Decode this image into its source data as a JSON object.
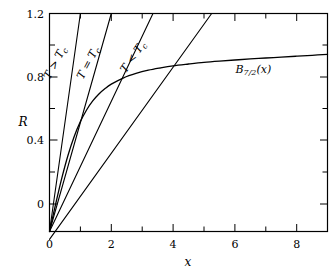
{
  "chart_data": {
    "type": "line",
    "title": "",
    "subtitle": "",
    "xlabel": "x",
    "ylabel": "R",
    "xlim": [
      0,
      9
    ],
    "ylim": [
      0,
      1.2
    ],
    "grid": false,
    "legend_position": "inline-annotations",
    "x_ticks_major": [
      0,
      2,
      4,
      6,
      8
    ],
    "x_ticks_minor": [
      1,
      3,
      5,
      7,
      9
    ],
    "x_tick_labels": [
      "0",
      "2",
      "4",
      "6",
      "8"
    ],
    "y_ticks_major": [
      0,
      0.4,
      0.8,
      1.2
    ],
    "y_ticks_minor": [
      0.2,
      0.6,
      1.0
    ],
    "y_tick_labels": [
      "0",
      "0.4",
      "0.8",
      "1.2"
    ],
    "series": [
      {
        "name": "B_{7/2}(x)",
        "label": "B",
        "label_sub": "7/2",
        "label_arg": "(x)",
        "kind": "brillouin",
        "J": 3.5,
        "annotation_x": 6.6,
        "annotation_y": 0.875,
        "points": [
          [
            0.0,
            0.0
          ],
          [
            0.2,
            0.152
          ],
          [
            0.4,
            0.295
          ],
          [
            0.6,
            0.42
          ],
          [
            0.8,
            0.523
          ],
          [
            1.0,
            0.605
          ],
          [
            1.2,
            0.669
          ],
          [
            1.4,
            0.719
          ],
          [
            1.6,
            0.757
          ],
          [
            1.8,
            0.787
          ],
          [
            2.0,
            0.811
          ],
          [
            2.4,
            0.846
          ],
          [
            2.8,
            0.87
          ],
          [
            3.2,
            0.888
          ],
          [
            3.6,
            0.901
          ],
          [
            4.0,
            0.912
          ],
          [
            4.5,
            0.922
          ],
          [
            5.0,
            0.931
          ],
          [
            5.5,
            0.938
          ],
          [
            6.0,
            0.944
          ],
          [
            6.5,
            0.95
          ],
          [
            7.0,
            0.955
          ],
          [
            7.5,
            0.96
          ],
          [
            8.0,
            0.965
          ],
          [
            8.5,
            0.97
          ],
          [
            9.0,
            0.975
          ]
        ]
      },
      {
        "name": "T > Tc line",
        "label": "T > T",
        "label_sub": "c",
        "kind": "straight",
        "slope": 1.2,
        "intercept": 0.0,
        "x_start": 0.0,
        "x_end": 1.0,
        "annotation_x": 0.28,
        "annotation_y": 0.92,
        "annotation_rotation": -62
      },
      {
        "name": "T = Tc line",
        "label": "T = T",
        "label_sub": "c",
        "kind": "straight",
        "slope": 0.6,
        "intercept": 0.0,
        "x_start": 0.0,
        "x_end": 2.0,
        "annotation_x": 1.35,
        "annotation_y": 0.92,
        "annotation_rotation": -62
      },
      {
        "name": "T < Tc line A",
        "label": "T < T",
        "label_sub": "c",
        "kind": "straight",
        "slope": 0.36,
        "intercept": 0.0,
        "x_start": 0.0,
        "x_end": 3.35,
        "annotation_x": 2.8,
        "annotation_y": 0.95,
        "annotation_rotation": -55
      },
      {
        "name": "T < Tc line B",
        "label": "",
        "kind": "straight",
        "slope": 0.237,
        "intercept": -0.043,
        "x_start": 0.0,
        "x_end": 5.25,
        "annotation_x": null,
        "annotation_y": null
      }
    ],
    "intersections": [
      [
        3.35,
        0.81
      ],
      [
        5.05,
        0.925
      ]
    ]
  },
  "axes": {
    "x_label": "x",
    "y_label": "R"
  },
  "labels": {
    "t_greater": "T > T",
    "t_equal": "T = T",
    "t_less": "T < T",
    "subscript_c": "c",
    "brillouin_main": "B",
    "brillouin_sub": "7/2",
    "brillouin_arg": "(x)"
  },
  "ticks": {
    "y0": "0",
    "y1": "0.4",
    "y2": "0.8",
    "y3": "1.2",
    "x0": "0",
    "x1": "2",
    "x2": "4",
    "x3": "6",
    "x4": "8"
  },
  "colors": {
    "line": "#000000",
    "background": "#ffffff"
  }
}
